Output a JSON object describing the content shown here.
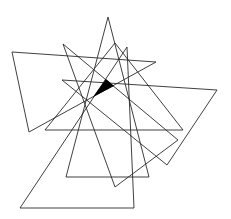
{
  "figure": {
    "width": 231,
    "height": 219,
    "background": "#ffffff",
    "stroke_color": "#2a2a2a",
    "stroke_width": 0.9,
    "fill_color": "#000000",
    "outlines": [
      {
        "name": "tall-triangle",
        "points": "108,17 66,177 149,177"
      },
      {
        "name": "left-triangle",
        "points": "12,52 156,62 29,132"
      },
      {
        "name": "slanted-triangle",
        "points": "63,44 115,187 178,140"
      },
      {
        "name": "bottom-triangle",
        "points": "127,47 20,208 134,208"
      },
      {
        "name": "mid-triangle",
        "points": "115,43 45,130 183,130"
      },
      {
        "name": "right-triangle",
        "points": "62,80 217,90 167,165"
      }
    ],
    "filled_region": {
      "name": "shaded-intersection",
      "points": "106,79 114,86 93,97"
    }
  }
}
